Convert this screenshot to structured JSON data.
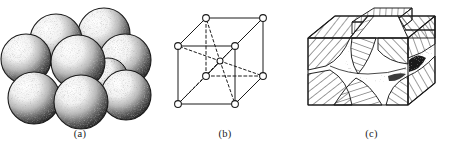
{
  "figure": {
    "background_color": "#ffffff",
    "ink_color": "#1a1a1a",
    "width": 453,
    "height": 167,
    "panels": [
      {
        "id": "a",
        "caption": "(a)",
        "subject": "close-packed-spheres",
        "description": "Cluster of shaded stippled spheres packed together representing atoms in a metal crystal",
        "sphere_count": 9,
        "render": {
          "style": "stippled-halftone",
          "highlight_direction": "upper-left",
          "shadow_direction": "lower-right",
          "outline_color": "#1a1a1a",
          "highlight_color": "#ffffff",
          "shadow_color": "#2b2b2b"
        },
        "spheres": [
          {
            "cx": 104,
            "cy": 34,
            "r": 26,
            "z": 1
          },
          {
            "cx": 56,
            "cy": 40,
            "r": 26,
            "z": 2
          },
          {
            "cx": 26,
            "cy": 59,
            "r": 25,
            "z": 3
          },
          {
            "cx": 125,
            "cy": 60,
            "r": 26,
            "z": 4
          },
          {
            "cx": 78,
            "cy": 62,
            "r": 27,
            "z": 5
          },
          {
            "cx": 126,
            "cy": 95,
            "r": 25,
            "z": 6
          },
          {
            "cx": 34,
            "cy": 98,
            "r": 26,
            "z": 7
          },
          {
            "cx": 81,
            "cy": 102,
            "r": 27,
            "z": 8
          },
          {
            "cx": 108,
            "cy": 78,
            "r": 20,
            "z": 9
          }
        ]
      },
      {
        "id": "b",
        "caption": "(b)",
        "subject": "body-centred-cubic-unit-cell",
        "description": "Body-centred cubic unit cell drawn in oblique projection with eight corner atoms, one centre atom, solid visible edges, dashed hidden edges and dashed diagonals joining the centre atom to every corner",
        "lattice_type": "body-centred cubic",
        "corner_atom_count": 8,
        "centre_atom_count": 1,
        "render": {
          "edge_color": "#1a1a1a",
          "hidden_edge_style": "dashed",
          "atom_fill": "#ffffff",
          "atom_stroke": "#1a1a1a",
          "atom_radius": 3.4,
          "centre_atom_radius": 3.0,
          "projection": "oblique"
        },
        "vertices": {
          "front_top_left": {
            "x": 18,
            "y": 46
          },
          "front_top_right": {
            "x": 75,
            "y": 46
          },
          "front_bot_left": {
            "x": 18,
            "y": 104
          },
          "front_bot_right": {
            "x": 75,
            "y": 104
          },
          "back_top_left": {
            "x": 46,
            "y": 18
          },
          "back_top_right": {
            "x": 103,
            "y": 18
          },
          "back_bot_left": {
            "x": 46,
            "y": 76
          },
          "back_bot_right": {
            "x": 103,
            "y": 76
          },
          "centre": {
            "x": 60,
            "y": 61
          }
        }
      },
      {
        "id": "c",
        "caption": "(c)",
        "subject": "polycrystalline-grain-structure",
        "description": "Cut-away cube showing many differently oriented crystal grains, each drawn with hatching running in a different direction, separated by stippled grain boundaries, with grain blocks protruding from the top surface",
        "grain_count": 12,
        "render": {
          "outline_color": "#1a1a1a",
          "hatch_color": "#1a1a1a",
          "stipple_color": "#333333",
          "hatch_spacing_px": 3.2,
          "boundary_style": "stippled"
        },
        "grains": [
          {
            "name": "top-left-face",
            "hatch_angle": 38
          },
          {
            "name": "top-centre-block",
            "hatch_angle": 4
          },
          {
            "name": "top-right-face",
            "hatch_angle": -38
          },
          {
            "name": "front-left-upper",
            "hatch_angle": 42
          },
          {
            "name": "front-left-lower",
            "hatch_angle": 52
          },
          {
            "name": "front-centre-upper",
            "hatch_angle": -70
          },
          {
            "name": "front-centre-lower",
            "hatch_angle": 72
          },
          {
            "name": "front-right-upper",
            "hatch_angle": -44
          },
          {
            "name": "front-right-lower",
            "hatch_angle": -56
          },
          {
            "name": "core-boundary",
            "hatch_angle": null
          },
          {
            "name": "right-face-upper",
            "hatch_angle": -20
          },
          {
            "name": "right-face-lower",
            "hatch_angle": -30
          }
        ],
        "cube": {
          "front_top_left": {
            "x": 18,
            "y": 38
          },
          "front_top_right": {
            "x": 118,
            "y": 38
          },
          "front_bot_left": {
            "x": 18,
            "y": 105
          },
          "front_bot_right": {
            "x": 118,
            "y": 105
          },
          "back_top_left": {
            "x": 45,
            "y": 16
          },
          "back_top_right": {
            "x": 145,
            "y": 16
          },
          "back_bot_right": {
            "x": 145,
            "y": 83
          }
        }
      }
    ]
  }
}
